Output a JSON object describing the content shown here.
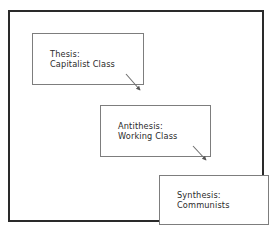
{
  "diagram": {
    "type": "flow-diagram",
    "frame_color": "#2a2a2a",
    "box_border_color": "#7d7d7d",
    "text_color": "#2b2b2b",
    "background": "#ffffff",
    "nodes": [
      {
        "id": "thesis",
        "label_line1": "Thesis:",
        "label_line2": "Capitalist Class"
      },
      {
        "id": "antithesis",
        "label_line1": "Antithesis:",
        "label_line2": "Working Class"
      },
      {
        "id": "synthesis",
        "label_line1": "Synthesis:",
        "label_line2": "Communists"
      }
    ],
    "arrows": [
      {
        "id": "thesis-to-antithesis",
        "from": "thesis",
        "to": "antithesis"
      },
      {
        "id": "antithesis-to-synthesis",
        "from": "antithesis",
        "to": "synthesis"
      }
    ]
  }
}
